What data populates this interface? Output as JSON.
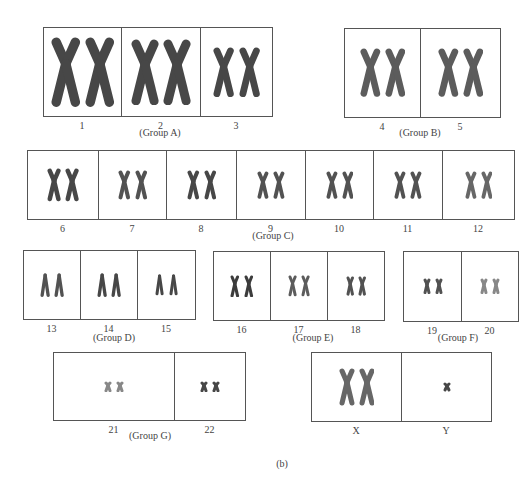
{
  "figure": {
    "caption": "(b)",
    "groups": [
      {
        "name": "(Group A)",
        "id": "A",
        "x": 43,
        "y": 27,
        "h": 88,
        "name_x": 160,
        "name_y": 133,
        "chromosomes": [
          {
            "label": "1",
            "w": 78,
            "size": 1.0,
            "shade": 0.85
          },
          {
            "label": "2",
            "w": 79,
            "size": 0.95,
            "shade": 0.85
          },
          {
            "label": "3",
            "w": 72,
            "size": 0.72,
            "shade": 0.85
          }
        ]
      },
      {
        "name": "(Group B)",
        "id": "B",
        "x": 344,
        "y": 28,
        "h": 88,
        "name_x": 420,
        "name_y": 133,
        "chromosomes": [
          {
            "label": "4",
            "w": 76,
            "size": 0.7,
            "shade": 0.75
          },
          {
            "label": "5",
            "w": 80,
            "size": 0.7,
            "shade": 0.75
          }
        ]
      },
      {
        "name": "(Group C)",
        "id": "C",
        "x": 27,
        "y": 150,
        "h": 68,
        "name_x": 273,
        "name_y": 236,
        "chromosomes": [
          {
            "label": "6",
            "w": 71,
            "size": 0.62,
            "shade": 0.85
          },
          {
            "label": "7",
            "w": 68,
            "size": 0.55,
            "shade": 0.8
          },
          {
            "label": "8",
            "w": 70,
            "size": 0.55,
            "shade": 0.85
          },
          {
            "label": "9",
            "w": 69,
            "size": 0.52,
            "shade": 0.8
          },
          {
            "label": "10",
            "w": 68,
            "size": 0.52,
            "shade": 0.8
          },
          {
            "label": "11",
            "w": 69,
            "size": 0.52,
            "shade": 0.8
          },
          {
            "label": "12",
            "w": 72,
            "size": 0.52,
            "shade": 0.7
          }
        ]
      },
      {
        "name": "(Group D)",
        "id": "D",
        "x": 23,
        "y": 250,
        "h": 68,
        "name_x": 114,
        "name_y": 338,
        "chromosomes": [
          {
            "label": "13",
            "w": 57,
            "size": 0.45,
            "shade": 0.8,
            "acro": true
          },
          {
            "label": "14",
            "w": 57,
            "size": 0.45,
            "shade": 0.85,
            "acro": true
          },
          {
            "label": "15",
            "w": 58,
            "size": 0.4,
            "shade": 0.85,
            "acro": true
          }
        ]
      },
      {
        "name": "(Group E)",
        "id": "E",
        "x": 213,
        "y": 251,
        "h": 68,
        "name_x": 313,
        "name_y": 338,
        "chromosomes": [
          {
            "label": "16",
            "w": 57,
            "size": 0.42,
            "shade": 0.9
          },
          {
            "label": "17",
            "w": 57,
            "size": 0.4,
            "shade": 0.75
          },
          {
            "label": "18",
            "w": 57,
            "size": 0.37,
            "shade": 0.8
          }
        ]
      },
      {
        "name": "(Group F)",
        "id": "F",
        "x": 403,
        "y": 251,
        "h": 69,
        "name_x": 458,
        "name_y": 338,
        "chromosomes": [
          {
            "label": "19",
            "w": 58,
            "size": 0.3,
            "shade": 0.8
          },
          {
            "label": "20",
            "w": 57,
            "size": 0.3,
            "shade": 0.55
          }
        ]
      },
      {
        "name": "(Group G)",
        "id": "G",
        "x": 53,
        "y": 352,
        "h": 67,
        "name_x": 150,
        "name_y": 436,
        "chromosomes": [
          {
            "label": "21",
            "w": 121,
            "size": 0.22,
            "shade": 0.55,
            "small": true
          },
          {
            "label": "22",
            "w": 71,
            "size": 0.22,
            "shade": 0.85,
            "small": true
          }
        ]
      },
      {
        "name": "",
        "id": "XY",
        "x": 311,
        "y": 352,
        "h": 68,
        "name_x": 400,
        "name_y": 436,
        "chromosomes": [
          {
            "label": "X",
            "w": 90,
            "size": 0.7,
            "shade": 0.7
          },
          {
            "label": "Y",
            "w": 90,
            "size": 0.15,
            "shade": 0.85,
            "single": true
          }
        ]
      }
    ],
    "caption_x": 282,
    "caption_y": 458
  }
}
